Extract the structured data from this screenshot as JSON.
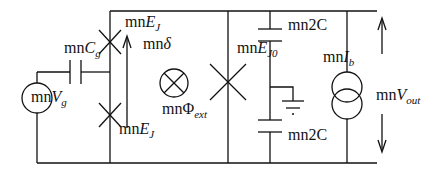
{
  "diagram": {
    "type": "circuit",
    "line_color": "#111111",
    "background": "#ffffff",
    "labels": {
      "cg": {
        "prefix": "mn",
        "main": "C",
        "sub": "g"
      },
      "vg": {
        "prefix": "mn",
        "main": "V",
        "sub": "g"
      },
      "ej_top": {
        "prefix": "mn",
        "main": "E",
        "sub": "J"
      },
      "ej_bottom": {
        "prefix": "mn",
        "main": "E",
        "sub": "J"
      },
      "delta": {
        "prefix": "mn",
        "main": "δ"
      },
      "phi_ext": {
        "prefix": "mn",
        "main": "Φ",
        "sub": "ext"
      },
      "ej0": {
        "prefix": "mn",
        "main": "E",
        "sub": "J0"
      },
      "cap_top": "mn2C",
      "cap_bottom": "mn2C",
      "ib": {
        "prefix": "mn",
        "main": "I",
        "sub": "b"
      },
      "vout": {
        "prefix": "mn",
        "main": "V",
        "sub": "out"
      }
    },
    "components": [
      "voltage-source Vg",
      "capacitor Cg",
      "josephson-junction EJ (top)",
      "josephson-junction EJ (bottom)",
      "phase arrow delta",
      "external flux Phi_ext",
      "josephson-junction EJ0",
      "capacitor 2C (top)",
      "ground",
      "capacitor 2C (bottom)",
      "current source Ib",
      "output voltage Vout arrows"
    ]
  }
}
